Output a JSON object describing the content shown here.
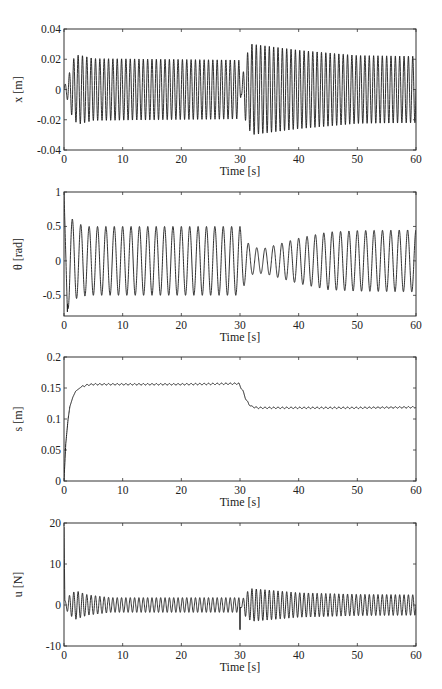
{
  "caption_partial": "... (partial caption cut off at top) ...",
  "chart_data": [
    {
      "type": "line",
      "title": "",
      "xlabel": "Time [s]",
      "ylabel": "x [m]",
      "xlim": [
        0,
        60
      ],
      "ylim": [
        -0.04,
        0.04
      ],
      "xticks": [
        0,
        10,
        20,
        30,
        40,
        50,
        60
      ],
      "yticks": [
        -0.04,
        -0.02,
        0,
        0.02,
        0.04
      ],
      "ytick_labels": [
        "-0.04",
        "-0.02",
        "0",
        "0.02",
        "0.04"
      ],
      "grid": false,
      "description": "Oscillation ~1.35 Hz; envelope grows to ~0.023 by t=2.5s, settles ~0.020 until t=30; after disturbance at t=30 jumps to ~0.030 at t=32 then decays to ~0.022 by t=60",
      "envelope": {
        "t": [
          0,
          0.5,
          1,
          1.5,
          2.5,
          5,
          29.8,
          30.2,
          31,
          32,
          40,
          50,
          60
        ],
        "amp": [
          0.002,
          0.006,
          0.012,
          0.02,
          0.023,
          0.0205,
          0.0195,
          0.003,
          0.022,
          0.03,
          0.026,
          0.0225,
          0.022
        ]
      },
      "freq_hz": 1.35
    },
    {
      "type": "line",
      "title": "",
      "xlabel": "Time [s]",
      "ylabel": "θ [rad]",
      "xlim": [
        0,
        60
      ],
      "ylim": [
        -0.8,
        1
      ],
      "xticks": [
        0,
        10,
        20,
        30,
        40,
        50,
        60
      ],
      "yticks": [
        -0.5,
        0,
        0.5,
        1
      ],
      "ytick_labels": [
        "-0.5",
        "0",
        "0.5",
        "1"
      ],
      "grid": false,
      "description": "Starts at 1 rad, swings to ~-0.8 then +0.65; steady oscillation ±0.5 (~0.7 Hz) until t=30; drops to ±0.2 around t=32-34, then grows back to ~±0.45 by t=60",
      "envelope": {
        "t": [
          0,
          1,
          2,
          4,
          30,
          31,
          32,
          34,
          40,
          45,
          50,
          60
        ],
        "amp": [
          0.8,
          0.65,
          0.55,
          0.5,
          0.5,
          0.3,
          0.2,
          0.18,
          0.33,
          0.42,
          0.44,
          0.45
        ]
      },
      "freq_hz": 0.7
    },
    {
      "type": "line",
      "title": "",
      "xlabel": "Time [s]",
      "ylabel": "s [m]",
      "xlim": [
        0,
        60
      ],
      "ylim": [
        0,
        0.2
      ],
      "xticks": [
        0,
        10,
        20,
        30,
        40,
        50,
        60
      ],
      "yticks": [
        0,
        0.05,
        0.1,
        0.15,
        0.2
      ],
      "ytick_labels": [
        "0",
        "0.05",
        "0.1",
        "0.15",
        "0.2"
      ],
      "grid": false,
      "description": "Rises from 0 to ~0.155 by t≈4s with tiny ripple; stays ~0.155 until t=30; decays to ~0.118 by t≈33 and holds with small ripple",
      "x": [
        0,
        0.3,
        0.7,
        1,
        1.5,
        2,
        3,
        4,
        5,
        10,
        20,
        29.8,
        30.5,
        31,
        31.5,
        32,
        33,
        35,
        40,
        50,
        60
      ],
      "y": [
        0,
        0.06,
        0.1,
        0.12,
        0.135,
        0.145,
        0.152,
        0.155,
        0.156,
        0.156,
        0.156,
        0.157,
        0.145,
        0.132,
        0.124,
        0.12,
        0.118,
        0.118,
        0.118,
        0.118,
        0.119
      ]
    },
    {
      "type": "line",
      "title": "",
      "xlabel": "Time [s]",
      "ylabel": "u [N]",
      "xlim": [
        0,
        60
      ],
      "ylim": [
        -10,
        20
      ],
      "xticks": [
        0,
        10,
        20,
        30,
        40,
        50,
        60
      ],
      "yticks": [
        -10,
        0,
        10,
        20
      ],
      "ytick_labels": [
        "-10",
        "0",
        "10",
        "20"
      ],
      "grid": false,
      "description": "Initial spike ~19 N at t=0; oscillation ±3.5 N settling to ±1.8 N until t=30; spike to ~-6 at t=30; then ±4 N at t=32 decaying to ~±2.5 N at t=60",
      "spikes": [
        {
          "t": 0,
          "value": 19
        },
        {
          "t": 30,
          "value": -6
        }
      ],
      "envelope": {
        "t": [
          0.3,
          1,
          2,
          4,
          8,
          29.8,
          30.2,
          31,
          32,
          40,
          50,
          60
        ],
        "amp": [
          1.0,
          2.5,
          3.5,
          2.5,
          1.8,
          1.8,
          0.6,
          3.0,
          4.0,
          3.0,
          2.6,
          2.5
        ]
      },
      "freq_hz": 1.35
    }
  ],
  "plots": [
    {
      "ylabel": "x [m]",
      "xlabel": "Time [s]"
    },
    {
      "ylabel": "θ [rad]",
      "xlabel": "Time [s]"
    },
    {
      "ylabel": "s [m]",
      "xlabel": "Time [s]"
    },
    {
      "ylabel": "u [N]",
      "xlabel": "Time [s]"
    }
  ],
  "colors": {
    "line": "#1a1a1a",
    "axes": "#333333",
    "background": "#ffffff"
  }
}
